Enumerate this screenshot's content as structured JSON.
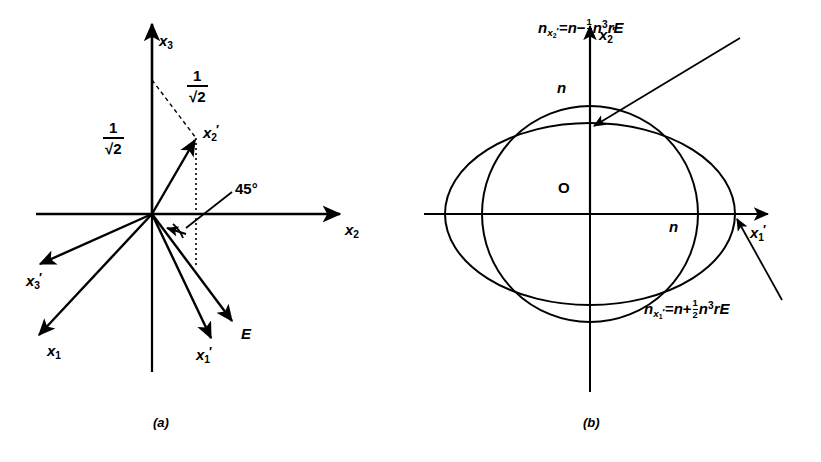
{
  "figure": {
    "kind": "two-panel scientific line diagram",
    "panel_a": {
      "caption": "(a)",
      "axes": [
        {
          "name": "x3-axis",
          "label_base": "x",
          "label_sub": "3",
          "prime": false,
          "direction": "up"
        },
        {
          "name": "x2-axis",
          "label_base": "x",
          "label_sub": "2",
          "prime": false,
          "direction": "right"
        }
      ],
      "labels": {
        "x3": {
          "base": "x",
          "sub": "3",
          "prime": false
        },
        "x2": {
          "base": "x",
          "sub": "2",
          "prime": false
        },
        "x1": {
          "base": "x",
          "sub": "1",
          "prime": false
        },
        "x1p": {
          "base": "x",
          "sub": "1",
          "prime": true
        },
        "x2p": {
          "base": "x",
          "sub": "2",
          "prime": true
        },
        "x3p": {
          "base": "x",
          "sub": "3",
          "prime": true
        },
        "E": {
          "base": "E",
          "sub": "",
          "prime": false
        }
      },
      "fractions": [
        {
          "name": "projection-on-x3",
          "numerator": "1",
          "denominator": "√2"
        },
        {
          "name": "projection-on-x2p",
          "numerator": "1",
          "denominator": "√2"
        }
      ],
      "angle_label": "45°",
      "vectors": [
        {
          "name": "x2-prime-vector",
          "label": "x′2",
          "direction": "up-right"
        },
        {
          "name": "x3-prime-vector",
          "label": "x′3",
          "direction": "down-left-shallow"
        },
        {
          "name": "x1-vector",
          "label": "x1",
          "direction": "down-left-steep"
        },
        {
          "name": "x1-prime-vector",
          "label": "x′1",
          "direction": "down-right-steep"
        },
        {
          "name": "E-field-vector",
          "label": "E",
          "direction": "down-right"
        }
      ]
    },
    "panel_b": {
      "caption": "(b)",
      "axes": [
        {
          "name": "x2-prime-axis",
          "label_base": "x",
          "label_sub": "2",
          "prime": true,
          "direction": "up"
        },
        {
          "name": "x1-prime-axis",
          "label_base": "x",
          "label_sub": "1",
          "prime": true,
          "direction": "right"
        }
      ],
      "origin_label": "O",
      "index_labels": [
        {
          "name": "n-vertical",
          "text": "n"
        },
        {
          "name": "n-horizontal",
          "text": "n"
        }
      ],
      "curves": [
        {
          "name": "index-circle",
          "description": "circle of radius n"
        },
        {
          "name": "index-ellipse",
          "description": "ellipse elongated along x1-prime"
        }
      ],
      "equations": [
        {
          "name": "n-x2-prime-equation",
          "lhs_base": "n",
          "lhs_sub_base": "x",
          "lhs_sub_sub": "2",
          "lhs_sub_prime": true,
          "equals": "=",
          "rhs_first": "n",
          "sign": "−",
          "frac_num": "1",
          "frac_den": "2",
          "rhs_tail_base": "n",
          "rhs_tail_exp": "3",
          "rhs_tail_rest": "rE",
          "plain": "n(x'2) = n − ½ n³ rE"
        },
        {
          "name": "n-x1-prime-equation",
          "lhs_base": "n",
          "lhs_sub_base": "x",
          "lhs_sub_sub": "1",
          "lhs_sub_prime": true,
          "equals": "=",
          "rhs_first": "n",
          "sign": "+",
          "frac_num": "1",
          "frac_den": "2",
          "rhs_tail_base": "n",
          "rhs_tail_exp": "3",
          "rhs_tail_rest": "rE",
          "plain": "n(x'1) = n + ½ n³ rE"
        }
      ]
    }
  },
  "style": {
    "stroke": "#000000",
    "background": "#ffffff"
  }
}
